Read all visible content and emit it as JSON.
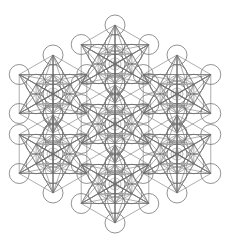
{
  "diagram": {
    "title": "Metatron's Cube rosette",
    "background": "#ffffff",
    "stroke_color": "#6e6e6e",
    "inner_stroke_color": "#b4b4b4",
    "line_width": 0.75,
    "circle_radius": 10,
    "outer_ring_distance": 39,
    "inner_ring_distance": 19.5,
    "rosette_radius": 6,
    "units": [
      {
        "name": "top",
        "cx": 115,
        "cy": 64
      },
      {
        "name": "upper-left",
        "cx": 53,
        "cy": 94
      },
      {
        "name": "upper-right",
        "cx": 177,
        "cy": 94
      },
      {
        "name": "center",
        "cx": 115,
        "cy": 124
      },
      {
        "name": "lower-left",
        "cx": 53,
        "cy": 154
      },
      {
        "name": "lower-right",
        "cx": 177,
        "cy": 154
      },
      {
        "name": "bottom",
        "cx": 115,
        "cy": 184
      }
    ]
  }
}
